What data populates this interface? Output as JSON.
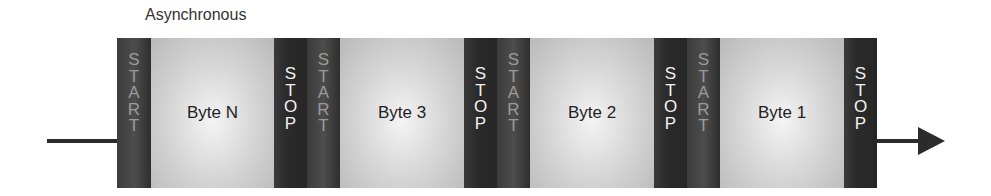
{
  "title": "Asynchronous",
  "start_letters": [
    "S",
    "T",
    "A",
    "R",
    "T"
  ],
  "stop_letters": [
    "S",
    "T",
    "O",
    "P"
  ],
  "bytes": [
    "Byte N",
    "Byte 3",
    "Byte 2",
    "Byte 1"
  ],
  "colors": {
    "frame_dark": "#2a2a2a",
    "byte_light": "#d8d8d8",
    "stop_text": "#f2f2f2",
    "start_text": "#9a9a9a",
    "arrow": "#2b2b2b"
  }
}
